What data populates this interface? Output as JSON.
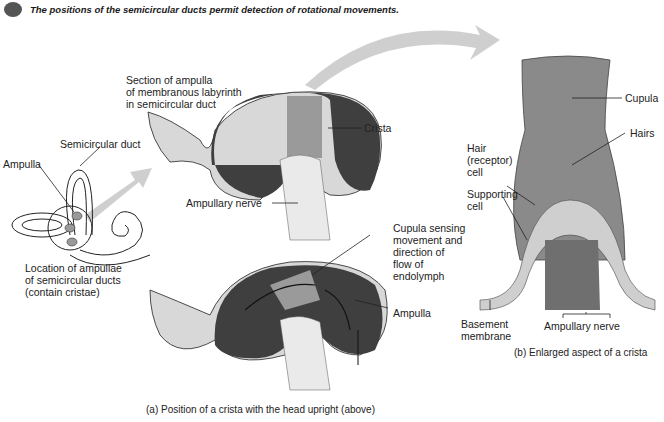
{
  "header": {
    "icon": "key-icon",
    "title": "The positions of the semicircular ducts permit detection of rotational movements."
  },
  "labels": {
    "semicircular_duct": "Semicircular duct",
    "ampulla_left": "Ampulla",
    "location_caption": [
      "Location of ampullae",
      "of semicircular ducts",
      "(contain cristae)"
    ],
    "section_caption": [
      "Section of ampulla",
      "of membranous labyrinth",
      "in semicircular duct"
    ],
    "crista": "Crista",
    "ampullary_nerve_a": "Ampullary nerve",
    "cupula_sensing": [
      "Cupula sensing",
      "movement and",
      "direction of",
      "flow of",
      "endolymph"
    ],
    "ampulla_lower": "Ampulla",
    "cupula": "Cupula",
    "hairs": "Hairs",
    "hair_cell": [
      "Hair",
      "(receptor)",
      "cell"
    ],
    "supporting_cell": [
      "Supporting",
      "cell"
    ],
    "basement_membrane": [
      "Basement",
      "membrane"
    ],
    "ampullary_nerve_b": "Ampullary nerve"
  },
  "captions": {
    "a": "(a) Position of a crista with the head upright (above)",
    "b": "(b) Enlarged aspect of a crista"
  },
  "colors": {
    "ampulla_fill": "#4a4a4a",
    "cupula_fill": "#8a8a8a",
    "arrow": "#c8c8c8",
    "line": "#222222"
  }
}
